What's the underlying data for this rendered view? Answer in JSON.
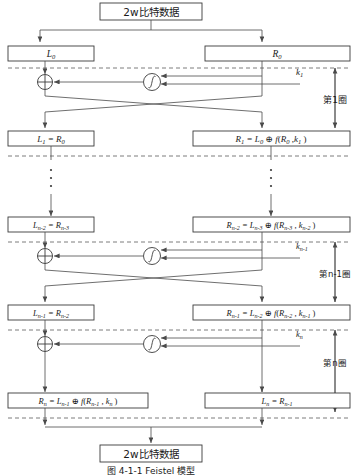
{
  "figure": {
    "caption": "图 4-1-1  Feistel 模型",
    "top_block": "2w比特数据",
    "bottom_block": "2w比特数据"
  },
  "round_labels": {
    "round1": "第1圈",
    "round_n_minus_1": "第n-1圈",
    "round_n": "第n圈"
  },
  "keys": {
    "k1": "k",
    "k1_sub": "1",
    "kn1": "k",
    "kn1_sub": "n-1",
    "kn": "k",
    "kn_sub": "n"
  },
  "icons": {
    "xor": "xor-circle-icon",
    "func": "f-function-icon",
    "arrow": "arrow-head-icon",
    "vertical_ellipsis": "vertical-ellipsis-icon"
  },
  "boxes": {
    "L0": "L₀",
    "R0": "R₀",
    "L1": "L₁ = R₀",
    "R1": "R₁ = L₀ ⊕ f(R₀ , k₁ )",
    "Ln2": "L n−2 = R n−3",
    "Rn2": "R n−2 = L n−3 ⊕ f(R n−3 , k n−2 )",
    "Ln1": "L n−1 = R n−2",
    "Rn1": "R n−1 = L n−2 ⊕ f(R n−2 , k n−1 )",
    "Rn": "R n = L n−1 ⊕ f(R n−1 , k n )",
    "Ln": "L n = R n−1"
  },
  "colors": {
    "stroke": "#3a3a3a",
    "line": "#4a4a4a",
    "dash": "#5a5a5a",
    "text": "#1a1a1a",
    "background": "#ffffff"
  }
}
